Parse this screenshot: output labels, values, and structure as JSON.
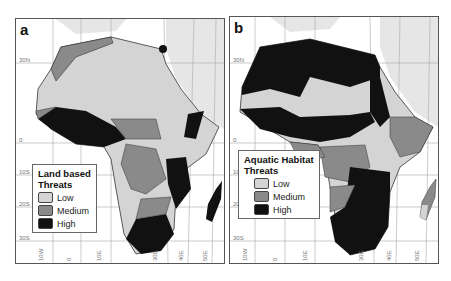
{
  "figure": {
    "panels": [
      {
        "id": "a",
        "label": "a",
        "legend": {
          "title_line1": "Land based",
          "title_line2": "Threats",
          "items": [
            {
              "label": "Low",
              "color": "#d4d4d4"
            },
            {
              "label": "Medium",
              "color": "#8a8a8a"
            },
            {
              "label": "High",
              "color": "#111111"
            }
          ]
        }
      },
      {
        "id": "b",
        "label": "b",
        "legend": {
          "title_line1": "Aquatic Habitat",
          "title_line2": "Threats",
          "items": [
            {
              "label": "Low",
              "color": "#d4d4d4"
            },
            {
              "label": "Medium",
              "color": "#8a8a8a"
            },
            {
              "label": "High",
              "color": "#111111"
            }
          ]
        }
      }
    ],
    "lat_labels": [
      "30N",
      "0",
      "10S",
      "20S",
      "30S"
    ],
    "lon_labels": [
      "10W",
      "0",
      "10E",
      "30E",
      "40E",
      "50E"
    ],
    "colors": {
      "low": "#d4d4d4",
      "medium": "#8a8a8a",
      "high": "#111111",
      "land_outside": "#e6e6e6",
      "grid": "#aaaaaa"
    }
  }
}
